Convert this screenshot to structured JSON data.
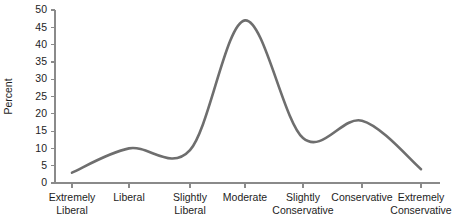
{
  "chart_data": {
    "type": "line",
    "title": "",
    "subtitle": "",
    "xlabel": "",
    "ylabel": "Percent",
    "categories": [
      "Extremely Liberal",
      "Liberal",
      "Slightly Liberal",
      "Moderate",
      "Slightly Conservative",
      "Conservative",
      "Extremely Conservative"
    ],
    "category_lines": [
      [
        "Extremely",
        "Liberal"
      ],
      [
        "Liberal"
      ],
      [
        "Slightly",
        "Liberal"
      ],
      [
        "Moderate"
      ],
      [
        "Slightly",
        "Conservative"
      ],
      [
        "Conservative"
      ],
      [
        "Extremely",
        "Conservative"
      ]
    ],
    "values": [
      3,
      10,
      9.5,
      47,
      13,
      18,
      4
    ],
    "ylim": [
      0,
      50
    ],
    "ytick_values": [
      0,
      5,
      10,
      15,
      20,
      25,
      30,
      35,
      40,
      45,
      50
    ],
    "ytick_labels": [
      "0",
      "5",
      "10",
      "15",
      "20",
      "25",
      "30",
      "35",
      "40",
      "45",
      "50"
    ],
    "grid": false,
    "legend": false,
    "legend_position": "none",
    "smoothing": "spline",
    "line_color": "#6e6e6e",
    "axis_color": "#8a8a8a",
    "text_color": "#1d1d1d",
    "background_color": "#ffffff",
    "annotations": []
  },
  "layout": {
    "plot_left_px": 55,
    "plot_right_px": 440,
    "plot_baseline_px": 183,
    "plot_top_px": 10,
    "tick_x_positions": [
      72,
      129,
      190,
      245,
      303,
      362,
      421
    ]
  }
}
